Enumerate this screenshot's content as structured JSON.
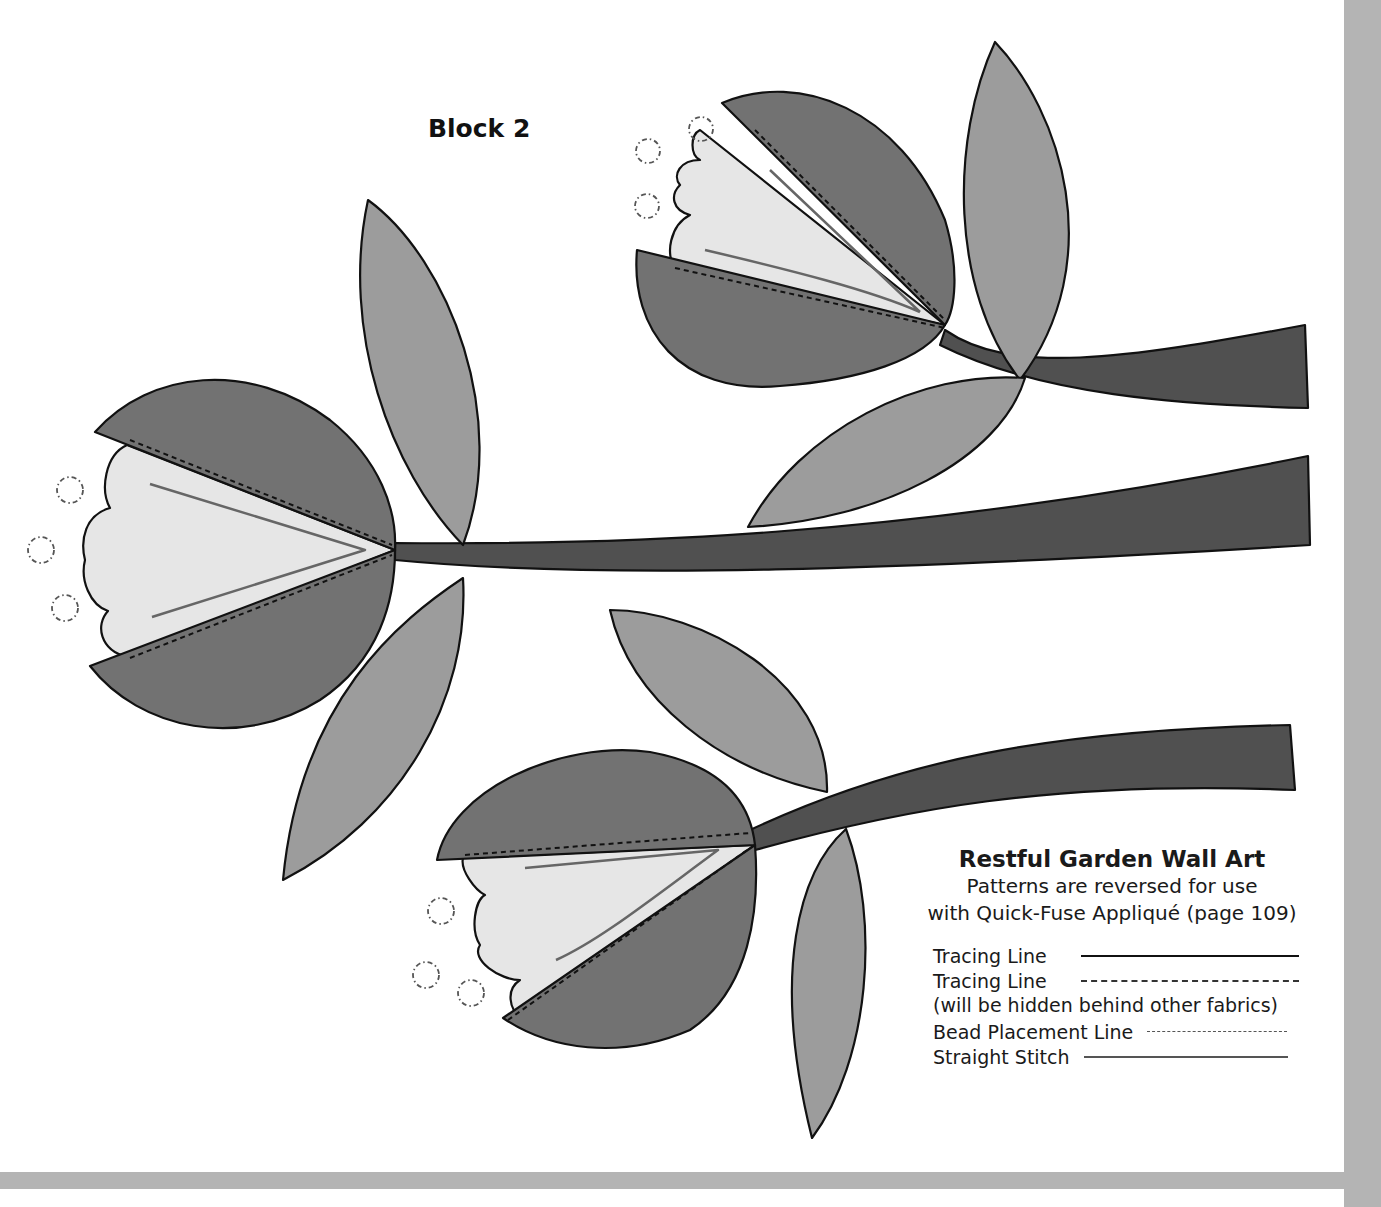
{
  "block_title": "Block 2",
  "legend": {
    "title": "Restful Garden Wall Art",
    "subtitle_line1": "Patterns are reversed for use",
    "subtitle_line2": "with Quick-Fuse Appliqué (page 109)",
    "items": [
      {
        "label": "Tracing Line",
        "style": "solid"
      },
      {
        "label": "Tracing Line",
        "style": "dashed"
      },
      {
        "label": "(will be hidden behind other fabrics)",
        "style": "note"
      },
      {
        "label": "Bead Placement Line",
        "style": "dash-dot"
      },
      {
        "label": "Straight Stitch",
        "style": "solid-gray"
      }
    ]
  },
  "colors": {
    "petal_dark": "#727272",
    "leaf": "#9c9c9c",
    "stem": "#505050",
    "inner_petal": "#e6e6e6",
    "frame_bar": "#b4b4b4"
  }
}
